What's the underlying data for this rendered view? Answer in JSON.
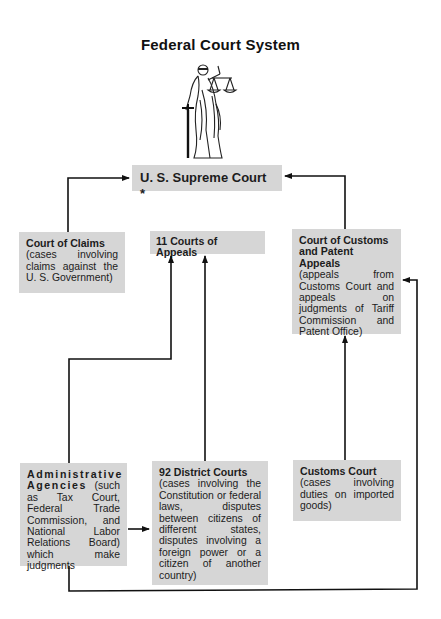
{
  "title": "Federal Court System",
  "figure": {
    "icon": "lady-justice-icon"
  },
  "nodes": {
    "supreme": {
      "head": "U. S. Supreme Court *"
    },
    "claims": {
      "head": "Court of Claims",
      "desc": "(cases involving claims against the U. S. Government)"
    },
    "appeals": {
      "head": "11 Courts of Appeals"
    },
    "ccpa": {
      "head": "Court of Customs and Patent Appeals",
      "desc": "(appeals from Customs Court and appeals on judgments of Tariff Commission and Patent Office)"
    },
    "admin": {
      "head": "Administrative Agencies",
      "desc": " (such as Tax Court, Federal Trade Commission, and National Labor Relations Board) which make judgments"
    },
    "district": {
      "head": "92 District Courts",
      "desc": "(cases involving the Constitution or federal laws, disputes between citizens of different states, disputes involving a foreign power or a citizen of another country)"
    },
    "customs": {
      "head": "Customs Court",
      "desc": "(cases involving duties on imported goods)"
    }
  },
  "edges": [
    {
      "from": "Court of Claims",
      "to": "U. S. Supreme Court *"
    },
    {
      "from": "Court of Customs and Patent Appeals",
      "to": "U. S. Supreme Court *"
    },
    {
      "from": "Administrative Agencies",
      "to": "11 Courts of Appeals"
    },
    {
      "from": "92 District Courts",
      "to": "11 Courts of Appeals"
    },
    {
      "from": "Customs Court",
      "to": "Court of Customs and Patent Appeals"
    },
    {
      "from": "Administrative Agencies",
      "to": "92 District Courts"
    },
    {
      "from": "Administrative Agencies",
      "to": "Court of Customs and Patent Appeals"
    }
  ],
  "colors": {
    "box": "#d6d6d6",
    "line": "#111111",
    "text": "#1c1c1c"
  }
}
